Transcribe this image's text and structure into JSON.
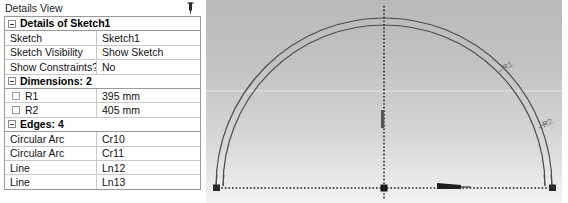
{
  "panel": {
    "title": "Details View",
    "pin_icon": "pin-icon",
    "groups": [
      {
        "label": "Details of Sketch1",
        "rows": [
          {
            "name": "Sketch",
            "value": "Sketch1",
            "checkbox": false
          },
          {
            "name": "Sketch Visibility",
            "value": "Show Sketch",
            "checkbox": false
          },
          {
            "name": "Show Constraints?",
            "value": "No",
            "checkbox": false
          }
        ]
      },
      {
        "label": "Dimensions: 2",
        "rows": [
          {
            "name": "R1",
            "value": "395 mm",
            "checkbox": true
          },
          {
            "name": "R2",
            "value": "405 mm",
            "checkbox": true
          }
        ]
      },
      {
        "label": "Edges: 4",
        "rows": [
          {
            "name": "Circular Arc",
            "value": "Cr10",
            "checkbox": false
          },
          {
            "name": "Circular Arc",
            "value": "Cr11",
            "checkbox": false
          },
          {
            "name": "Line",
            "value": "Ln12",
            "checkbox": false
          },
          {
            "name": "Line",
            "value": "Ln13",
            "checkbox": false
          }
        ]
      }
    ]
  },
  "viewport": {
    "dimension_labels": [
      {
        "id": "R1",
        "text": "R1"
      },
      {
        "id": "R2",
        "text": "R2"
      }
    ],
    "geometry": {
      "inner_arc": "Cr10",
      "outer_arc": "Cr11",
      "baseline": "Ln12",
      "axis": "Ln13"
    },
    "colors": {
      "geometry": "#3c3c3c",
      "construction": "#2b2b2b",
      "background_top": "#b9b9b9",
      "background_bottom": "#f4f4f4",
      "label": "#6e6e6e"
    }
  }
}
